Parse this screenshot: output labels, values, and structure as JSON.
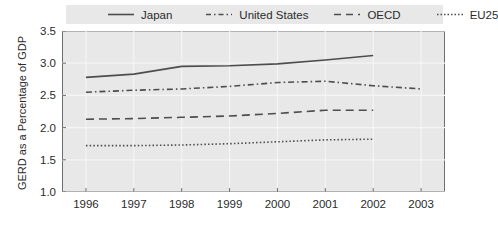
{
  "legend": {
    "position": "top",
    "entries": [
      {
        "label": "Japan",
        "style": "solid",
        "name": "legend-item-japan"
      },
      {
        "label": "United States",
        "style": "dashdot",
        "name": "legend-item-united-states"
      },
      {
        "label": "OECD",
        "style": "longdash",
        "name": "legend-item-oecd"
      },
      {
        "label": "EU25",
        "style": "dotted",
        "name": "legend-item-eu25"
      }
    ]
  },
  "axes": {
    "ylabel": "GERD as a Percentage of GDP",
    "xlabel": "",
    "yticks": [
      "1.0",
      "1.5",
      "2.0",
      "2.5",
      "3.0",
      "3.5"
    ],
    "xticks": [
      "1996",
      "1997",
      "1998",
      "1999",
      "2000",
      "2001",
      "2002",
      "2003"
    ]
  },
  "colors": {
    "plot_background": "#e8e8e8",
    "legend_background": "#e8e8e8",
    "frame": "#6e6e6e",
    "gridline": "#f5f5f5",
    "line": "#4d4d4d",
    "text": "#2b2b2b",
    "page_background": "#ffffff"
  },
  "chart_data": {
    "type": "line",
    "title": "",
    "xlabel": "",
    "ylabel": "GERD as a Percentage of GDP",
    "x": [
      1996,
      1997,
      1998,
      1999,
      2000,
      2001,
      2002,
      2003
    ],
    "xlim": [
      1995.5,
      2003.5
    ],
    "ylim": [
      1.0,
      3.5
    ],
    "yticks": [
      1.0,
      1.5,
      2.0,
      2.5,
      3.0,
      3.5
    ],
    "grid": "horizontal-and-vertical",
    "legend_position": "top",
    "series": [
      {
        "name": "Japan",
        "style": "solid",
        "x": [
          1996,
          1997,
          1998,
          1999,
          2000,
          2001,
          2002
        ],
        "values": [
          2.78,
          2.83,
          2.95,
          2.96,
          2.99,
          3.05,
          3.12
        ]
      },
      {
        "name": "United States",
        "style": "dashdot",
        "x": [
          1996,
          1997,
          1998,
          1999,
          2000,
          2001,
          2002,
          2003
        ],
        "values": [
          2.55,
          2.58,
          2.6,
          2.64,
          2.7,
          2.72,
          2.65,
          2.6
        ]
      },
      {
        "name": "OECD",
        "style": "longdash",
        "x": [
          1996,
          1997,
          1998,
          1999,
          2000,
          2001,
          2002
        ],
        "values": [
          2.13,
          2.14,
          2.16,
          2.18,
          2.22,
          2.27,
          2.27
        ]
      },
      {
        "name": "EU25",
        "style": "dotted",
        "x": [
          1996,
          1997,
          1998,
          1999,
          2000,
          2001,
          2002
        ],
        "values": [
          1.72,
          1.72,
          1.73,
          1.75,
          1.78,
          1.81,
          1.82
        ]
      }
    ]
  }
}
